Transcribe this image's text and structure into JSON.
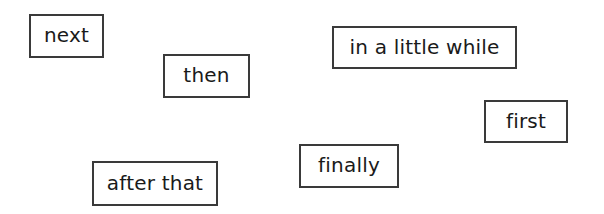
{
  "worksheet": {
    "word_cards": [
      {
        "label": "next"
      },
      {
        "label": "then"
      },
      {
        "label": "in a little while"
      },
      {
        "label": "first"
      },
      {
        "label": "finally"
      },
      {
        "label": "after that"
      }
    ],
    "colors": {
      "border": "#3a3a3a",
      "text": "#1a1a1a",
      "background": "#ffffff"
    }
  }
}
